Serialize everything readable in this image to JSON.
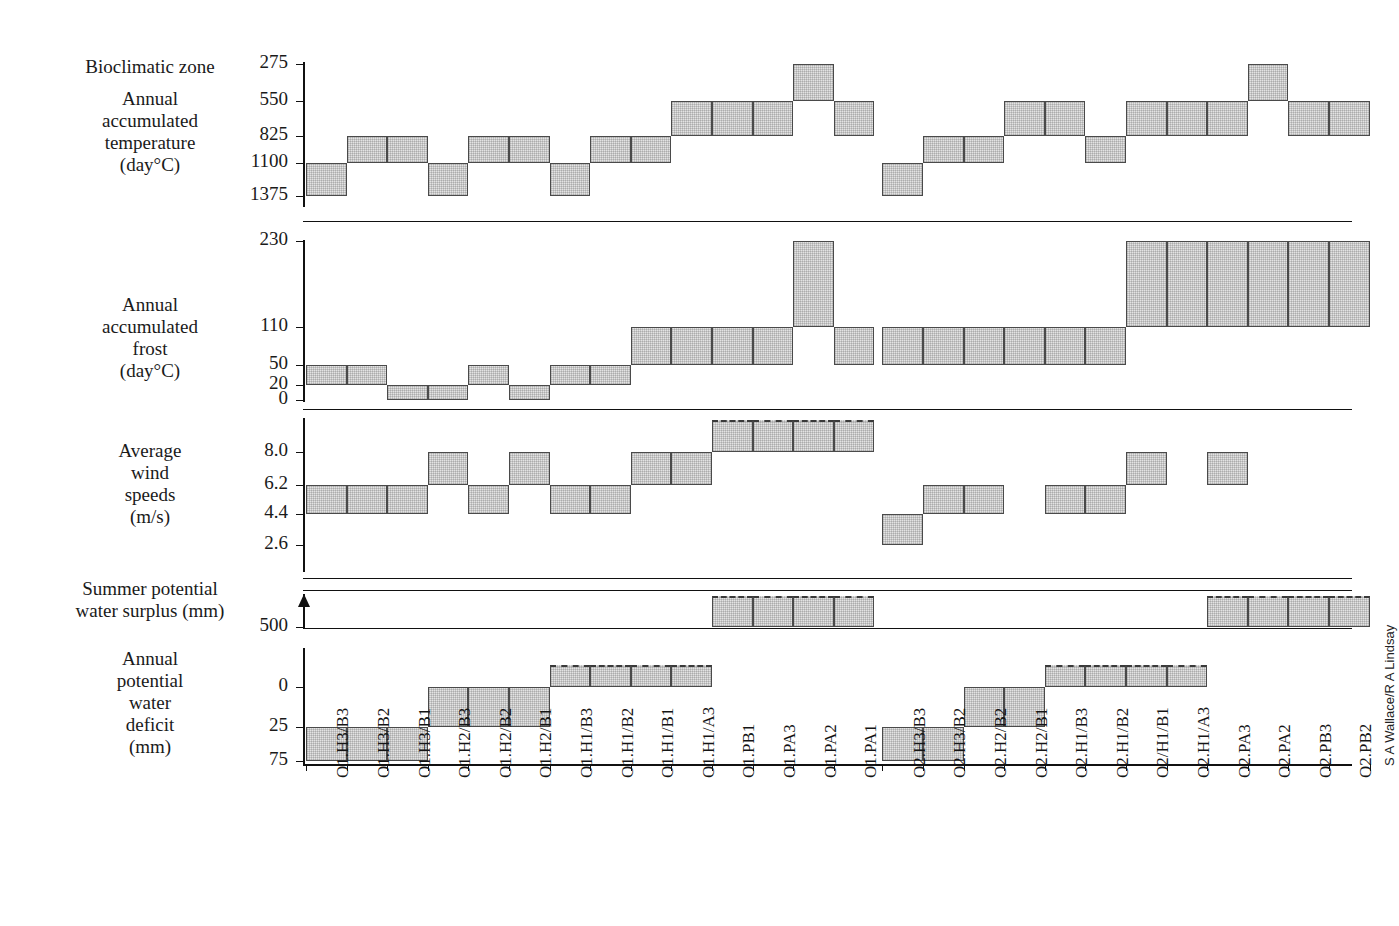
{
  "credit": "S A Wallace/R A Lindsay",
  "panels": [
    {
      "id": "bioclimatic-zone",
      "title_lines": [
        "Bioclimatic zone"
      ],
      "subtitle_lines": [
        "Annual",
        "accumulated",
        "temperature",
        "(day°C)"
      ],
      "ticks": [
        "275",
        "550",
        "825",
        "1100",
        "1375"
      ]
    },
    {
      "id": "annual-accumulated-frost",
      "title_lines": [],
      "subtitle_lines": [
        "Annual",
        "accumulated",
        "frost",
        "(day°C)"
      ],
      "ticks": [
        "230",
        "110",
        "50",
        "20",
        "0"
      ]
    },
    {
      "id": "average-wind-speeds",
      "title_lines": [],
      "subtitle_lines": [
        "Average",
        "wind",
        "speeds",
        "(m/s)"
      ],
      "ticks": [
        "8.0",
        "6.2",
        "4.4",
        "2.6"
      ]
    },
    {
      "id": "summer-potential-water-surplus",
      "title_lines": [
        "Summer potential",
        "water surplus (mm)"
      ],
      "subtitle_lines": [],
      "ticks": [
        "500"
      ]
    },
    {
      "id": "annual-potential-water-deficit",
      "title_lines": [],
      "subtitle_lines": [
        "Annual",
        "potential",
        "water",
        "deficit",
        "(mm)"
      ],
      "ticks": [
        "0",
        "25",
        "75"
      ]
    }
  ],
  "chart_data": {
    "type": "bar",
    "xlabel": "",
    "grid": false,
    "legend": "none",
    "categories": [
      "O1.H3/B3",
      "O1.H3/B2",
      "O1.H3/B1",
      "O1.H2/B3",
      "O1.H2/B2",
      "O1.H2/B1",
      "O1.H1/B3",
      "O1.H1/B2",
      "O1.H1/B1",
      "O1.H1/A3",
      "O1.PB1",
      "O1.PA3",
      "O1.PA2",
      "O1.PA1",
      "O2.H3/B3",
      "O2.H3/B2",
      "O2.H2/B2",
      "O2.H2/B1",
      "O2.H1/B3",
      "O2.H1/B2",
      "O2/H1/B1",
      "O2.H1/A3",
      "O2.PA3",
      "O2.PA2",
      "O2.PB3",
      "O2.PB2"
    ],
    "panels": [
      {
        "name": "Annual accumulated temperature (day°C)",
        "ylabel": "Annual accumulated temperature (day°C)",
        "ytick_labels": [
          "275",
          "550",
          "825",
          "1100",
          "1375"
        ],
        "axis_inverted": true,
        "bands": [
          {
            "cat": "O1.H3/B3",
            "low": "1375",
            "high": "1100"
          },
          {
            "cat": "O1.H3/B2",
            "low": "1100",
            "high": "825"
          },
          {
            "cat": "O1.H3/B1",
            "low": "1100",
            "high": "825"
          },
          {
            "cat": "O1.H2/B3",
            "low": "1375",
            "high": "1100"
          },
          {
            "cat": "O1.H2/B2",
            "low": "1100",
            "high": "825"
          },
          {
            "cat": "O1.H2/B1",
            "low": "1100",
            "high": "825"
          },
          {
            "cat": "O1.H1/B3",
            "low": "1375",
            "high": "1100"
          },
          {
            "cat": "O1.H1/B2",
            "low": "1100",
            "high": "825"
          },
          {
            "cat": "O1.H1/B1",
            "low": "1100",
            "high": "825"
          },
          {
            "cat": "O1.H1/A3",
            "low": "825",
            "high": "550"
          },
          {
            "cat": "O1.PB1",
            "low": "825",
            "high": "550"
          },
          {
            "cat": "O1.PA3",
            "low": "825",
            "high": "550"
          },
          {
            "cat": "O1.PA2",
            "low": "550",
            "high": "275"
          },
          {
            "cat": "O1.PA1",
            "low": "825",
            "high": "550"
          },
          {
            "cat": "O2.H3/B3",
            "low": "1375",
            "high": "1100"
          },
          {
            "cat": "O2.H3/B2",
            "low": "1100",
            "high": "825"
          },
          {
            "cat": "O2.H2/B2",
            "low": "1100",
            "high": "825"
          },
          {
            "cat": "O2.H2/B1",
            "low": "825",
            "high": "550"
          },
          {
            "cat": "O2.H1/B3",
            "low": "825",
            "high": "550"
          },
          {
            "cat": "O2.H1/B2",
            "low": "1100",
            "high": "825"
          },
          {
            "cat": "O2/H1/B1",
            "low": "825",
            "high": "550"
          },
          {
            "cat": "O2.H1/A3",
            "low": "825",
            "high": "550"
          },
          {
            "cat": "O2.PA3",
            "low": "825",
            "high": "550"
          },
          {
            "cat": "O2.PA2",
            "low": "550",
            "high": "275"
          },
          {
            "cat": "O2.PB3",
            "low": "825",
            "high": "550"
          },
          {
            "cat": "O2.PB2",
            "low": "825",
            "high": "550"
          }
        ]
      },
      {
        "name": "Annual accumulated frost (day°C)",
        "ylabel": "Annual accumulated frost (day°C)",
        "ytick_labels": [
          "230",
          "110",
          "50",
          "20",
          "0"
        ],
        "axis_inverted": false,
        "bands": [
          {
            "cat": "O1.H3/B3",
            "low": "20",
            "high": "50"
          },
          {
            "cat": "O1.H3/B2",
            "low": "20",
            "high": "50"
          },
          {
            "cat": "O1.H3/B1",
            "low": "0",
            "high": "20"
          },
          {
            "cat": "O1.H2/B3",
            "low": "0",
            "high": "20"
          },
          {
            "cat": "O1.H2/B2",
            "low": "20",
            "high": "50"
          },
          {
            "cat": "O1.H2/B1",
            "low": "0",
            "high": "20"
          },
          {
            "cat": "O1.H1/B3",
            "low": "20",
            "high": "50"
          },
          {
            "cat": "O1.H1/B2",
            "low": "20",
            "high": "50"
          },
          {
            "cat": "O1.H1/B1",
            "low": "50",
            "high": "110"
          },
          {
            "cat": "O1.H1/A3",
            "low": "50",
            "high": "110"
          },
          {
            "cat": "O1.PB1",
            "low": "50",
            "high": "110"
          },
          {
            "cat": "O1.PA3",
            "low": "50",
            "high": "110"
          },
          {
            "cat": "O1.PA2",
            "low": "110",
            "high": "230"
          },
          {
            "cat": "O1.PA1",
            "low": "50",
            "high": "110"
          },
          {
            "cat": "O2.H3/B3",
            "low": "50",
            "high": "110"
          },
          {
            "cat": "O2.H3/B2",
            "low": "50",
            "high": "110"
          },
          {
            "cat": "O2.H2/B2",
            "low": "50",
            "high": "110"
          },
          {
            "cat": "O2.H2/B1",
            "low": "50",
            "high": "110"
          },
          {
            "cat": "O2.H1/B3",
            "low": "50",
            "high": "110"
          },
          {
            "cat": "O2.H1/B2",
            "low": "50",
            "high": "110"
          },
          {
            "cat": "O2/H1/B1",
            "low": "110",
            "high": "230"
          },
          {
            "cat": "O2.H1/A3",
            "low": "110",
            "high": "230"
          },
          {
            "cat": "O2.PA3",
            "low": "110",
            "high": "230"
          },
          {
            "cat": "O2.PA2",
            "low": "110",
            "high": "230"
          },
          {
            "cat": "O2.PB3",
            "low": "110",
            "high": "230"
          },
          {
            "cat": "O2.PB2",
            "low": "110",
            "high": "230"
          }
        ]
      },
      {
        "name": "Average wind speeds (m/s)",
        "ylabel": "Average wind speeds (m/s)",
        "ytick_labels": [
          "8.0",
          "6.2",
          "4.4",
          "2.6"
        ],
        "axis_inverted": false,
        "bands": [
          {
            "cat": "O1.H3/B3",
            "low": "4.4",
            "high": "6.2"
          },
          {
            "cat": "O1.H3/B2",
            "low": "4.4",
            "high": "6.2"
          },
          {
            "cat": "O1.H3/B1",
            "low": "4.4",
            "high": "6.2"
          },
          {
            "cat": "O1.H2/B3",
            "low": "6.2",
            "high": "8.0"
          },
          {
            "cat": "O1.H2/B2",
            "low": "4.4",
            "high": "6.2"
          },
          {
            "cat": "O1.H2/B1",
            "low": "6.2",
            "high": "8.0"
          },
          {
            "cat": "O1.H1/B3",
            "low": "4.4",
            "high": "6.2"
          },
          {
            "cat": "O1.H1/B2",
            "low": "4.4",
            "high": "6.2"
          },
          {
            "cat": "O1.H1/B1",
            "low": "6.2",
            "high": "8.0"
          },
          {
            "cat": "O1.H1/A3",
            "low": "6.2",
            "high": "8.0"
          },
          {
            "cat": "O1.PB1",
            "low": "8.0",
            "high": ">8.0",
            "open": true
          },
          {
            "cat": "O1.PA3",
            "low": "8.0",
            "high": ">8.0",
            "open": true
          },
          {
            "cat": "O1.PA2",
            "low": "8.0",
            "high": ">8.0",
            "open": true
          },
          {
            "cat": "O1.PA1",
            "low": "8.0",
            "high": ">8.0",
            "open": true
          },
          {
            "cat": "O2.H3/B3",
            "low": "2.6",
            "high": "4.4"
          },
          {
            "cat": "O2.H3/B2",
            "low": "4.4",
            "high": "6.2"
          },
          {
            "cat": "O2.H2/B2",
            "low": "4.4",
            "high": "6.2"
          },
          {
            "cat": "O2.H1/B3",
            "low": "4.4",
            "high": "6.2"
          },
          {
            "cat": "O2.H1/B2",
            "low": "4.4",
            "high": "6.2"
          },
          {
            "cat": "O2/H1/B1",
            "low": "6.2",
            "high": "8.0"
          },
          {
            "cat": "O2.PA3",
            "low": "6.2",
            "high": "8.0"
          }
        ]
      },
      {
        "name": "Summer potential water surplus (mm)",
        "ylabel": "Summer potential water surplus (mm)",
        "ytick_labels": [
          "500"
        ],
        "axis_inverted": false,
        "bands": [
          {
            "cat": "O1.PB1",
            "low": "500",
            "high": ">500",
            "open": true
          },
          {
            "cat": "O1.PA3",
            "low": "500",
            "high": ">500",
            "open": true
          },
          {
            "cat": "O1.PA2",
            "low": "500",
            "high": ">500",
            "open": true
          },
          {
            "cat": "O1.PA1",
            "low": "500",
            "high": ">500",
            "open": true
          },
          {
            "cat": "O2.PA3",
            "low": "500",
            "high": ">500",
            "open": true
          },
          {
            "cat": "O2.PA2",
            "low": "500",
            "high": ">500",
            "open": true
          },
          {
            "cat": "O2.PB3",
            "low": "500",
            "high": ">500",
            "open": true
          },
          {
            "cat": "O2.PB2",
            "low": "500",
            "high": ">500",
            "open": true
          }
        ]
      },
      {
        "name": "Annual potential water deficit (mm)",
        "ylabel": "Annual potential water deficit (mm)",
        "ytick_labels": [
          "0",
          "25",
          "75"
        ],
        "axis_inverted": true,
        "bands": [
          {
            "cat": "O1.H3/B3",
            "low": "75",
            "high": "25"
          },
          {
            "cat": "O1.H3/B2",
            "low": "75",
            "high": "25"
          },
          {
            "cat": "O1.H3/B1",
            "low": "75",
            "high": "25"
          },
          {
            "cat": "O1.H2/B3",
            "low": "25",
            "high": "0"
          },
          {
            "cat": "O1.H2/B2",
            "low": "25",
            "high": "0"
          },
          {
            "cat": "O1.H2/B1",
            "low": "25",
            "high": "0"
          },
          {
            "cat": "O1.H1/B3",
            "low": "0",
            "high": "<0",
            "open": true
          },
          {
            "cat": "O1.H1/B2",
            "low": "0",
            "high": "<0",
            "open": true
          },
          {
            "cat": "O1.H1/B1",
            "low": "0",
            "high": "<0",
            "open": true
          },
          {
            "cat": "O1.H1/A3",
            "low": "0",
            "high": "<0",
            "open": true
          },
          {
            "cat": "O2.H3/B3",
            "low": "75",
            "high": "25"
          },
          {
            "cat": "O2.H3/B2",
            "low": "75",
            "high": "25"
          },
          {
            "cat": "O2.H2/B2",
            "low": "25",
            "high": "0"
          },
          {
            "cat": "O2.H2/B1",
            "low": "25",
            "high": "0"
          },
          {
            "cat": "O2.H1/B3",
            "low": "0",
            "high": "<0",
            "open": true
          },
          {
            "cat": "O2.H1/B2",
            "low": "0",
            "high": "<0",
            "open": true
          },
          {
            "cat": "O2/H1/B1",
            "low": "0",
            "high": "<0",
            "open": true
          },
          {
            "cat": "O2.H1/A3",
            "low": "0",
            "high": "<0",
            "open": true
          }
        ]
      }
    ]
  }
}
